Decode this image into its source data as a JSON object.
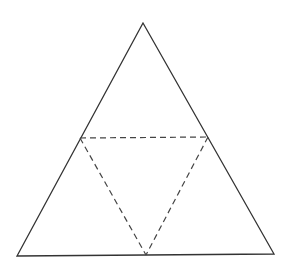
{
  "diagram": {
    "type": "triangle-net",
    "stroke_color": "#333333",
    "dash_color": "#444444",
    "background": "#ffffff",
    "outer_triangle": {
      "apex": [
        143,
        23
      ],
      "bottom_left": [
        17,
        256
      ],
      "bottom_right": [
        274,
        254
      ]
    },
    "inner_triangle": {
      "left_mid": [
        80,
        138
      ],
      "right_mid": [
        208,
        137
      ],
      "bottom_mid": [
        146,
        255
      ]
    }
  }
}
